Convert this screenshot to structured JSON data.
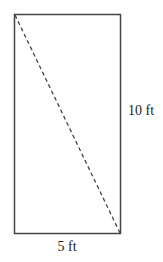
{
  "diagram": {
    "shape": "rectangle",
    "colors": {
      "stroke": "#444444",
      "text": "#222222",
      "background": "#ffffff"
    },
    "width_label": "5 ft",
    "height_label": "10 ft",
    "diagonal": {
      "style": "dashed",
      "from": "top-left",
      "to": "bottom-right"
    }
  }
}
